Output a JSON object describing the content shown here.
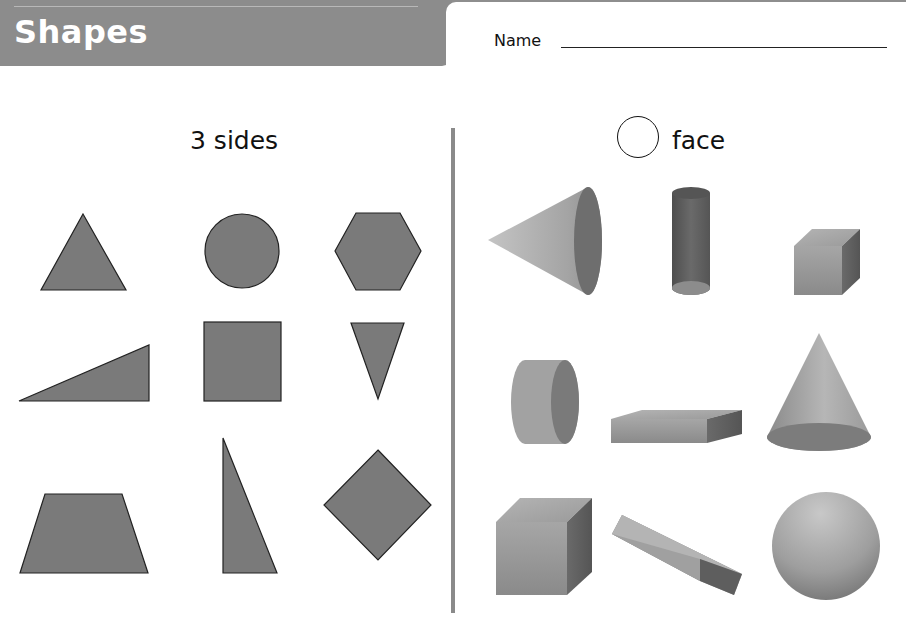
{
  "header": {
    "title": "Shapes",
    "name_label": "Name"
  },
  "left_panel": {
    "heading": "3 sides",
    "shapes": [
      {
        "name": "triangle",
        "row": 1,
        "col": 1
      },
      {
        "name": "circle",
        "row": 1,
        "col": 2
      },
      {
        "name": "hexagon",
        "row": 1,
        "col": 3
      },
      {
        "name": "right-triangle-wide",
        "row": 2,
        "col": 1
      },
      {
        "name": "square",
        "row": 2,
        "col": 2
      },
      {
        "name": "inverted-triangle",
        "row": 2,
        "col": 3
      },
      {
        "name": "trapezoid",
        "row": 3,
        "col": 1
      },
      {
        "name": "right-triangle-tall",
        "row": 3,
        "col": 2
      },
      {
        "name": "rhombus",
        "row": 3,
        "col": 3
      }
    ]
  },
  "right_panel": {
    "heading": "face",
    "heading_icon": "circle-outline-icon",
    "solids": [
      {
        "name": "cone-sideways",
        "row": 1,
        "col": 1
      },
      {
        "name": "cylinder-upright",
        "row": 1,
        "col": 2
      },
      {
        "name": "cube-small",
        "row": 1,
        "col": 3
      },
      {
        "name": "cylinder-sideways",
        "row": 2,
        "col": 1
      },
      {
        "name": "rectangular-prism-flat",
        "row": 2,
        "col": 2
      },
      {
        "name": "cone-upright",
        "row": 2,
        "col": 3
      },
      {
        "name": "cube-large",
        "row": 3,
        "col": 1
      },
      {
        "name": "rectangular-prism-tilted",
        "row": 3,
        "col": 2
      },
      {
        "name": "sphere",
        "row": 3,
        "col": 3
      }
    ]
  },
  "colors": {
    "header_gray": "#8c8c8c",
    "shape_fill": "#7a7a7a",
    "shape_stroke": "#222222",
    "divider": "#8a8a8a"
  }
}
